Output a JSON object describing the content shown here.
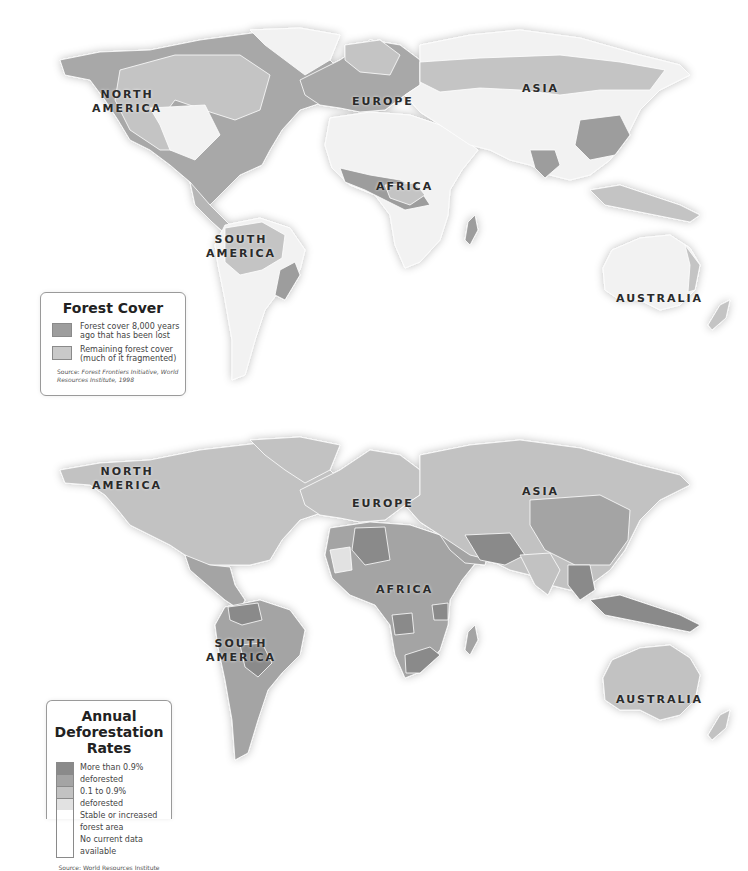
{
  "figure": {
    "maps": [
      {
        "id": "forest-cover",
        "legend": {
          "title": "Forest Cover",
          "items": [
            {
              "label": "Forest cover 8,000 years ago that has been lost",
              "color": "#9d9d9d"
            },
            {
              "label": "Remaining forest cover (much of it fragmented)",
              "color": "#c9c9c9"
            }
          ],
          "source_prefix": "Source:",
          "source": "Forest Frontiers Initiative, World Resources Institute, 1998"
        },
        "base_land_color": "#f2f2f2",
        "continent_labels": {
          "north_america": "NORTH\nAMERICA",
          "europe": "EUROPE",
          "asia": "ASIA",
          "africa": "AFRICA",
          "south_america": "SOUTH\nAMERICA",
          "australia": "AUSTRALIA"
        }
      },
      {
        "id": "deforestation-rates",
        "legend": {
          "title": "Annual Deforestation Rates",
          "items": [
            {
              "label": "More than 0.9% deforested",
              "color": "#8a8a8a"
            },
            {
              "label": "0.1 to 0.9% deforested",
              "color": "#a4a4a4"
            },
            {
              "label": "Stable or increased forest area",
              "color": "#c2c2c2"
            },
            {
              "label": "No current data available",
              "color": "#e2e2e2"
            }
          ],
          "source_prefix": "Source:",
          "source": "World Resources Institute"
        },
        "continent_labels": {
          "north_america": "NORTH\nAMERICA",
          "europe": "EUROPE",
          "asia": "ASIA",
          "africa": "AFRICA",
          "south_america": "SOUTH\nAMERICA",
          "australia": "AUSTRALIA"
        }
      }
    ]
  }
}
